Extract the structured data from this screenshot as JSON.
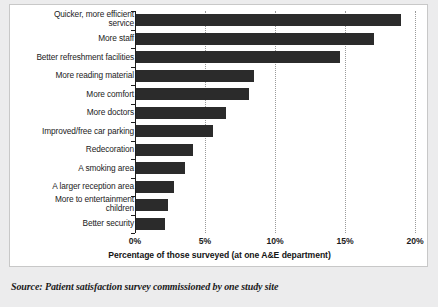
{
  "chart_data": {
    "type": "bar",
    "orientation": "horizontal",
    "title": "",
    "xlabel": "Percentage of those surveyed (at one A&E department)",
    "ylabel": "",
    "xlim": [
      0,
      20
    ],
    "xticks": [
      "0%",
      "5%",
      "10%",
      "15%",
      "20%"
    ],
    "xtick_values": [
      0,
      5,
      10,
      15,
      20
    ],
    "grid": "vertical-dotted",
    "legend": "none",
    "bar_color": "#2b2b2b",
    "categories": [
      "Quicker, more efficient service",
      "More staff",
      "Better refreshment facilities",
      "More reading material",
      "More comfort",
      "More doctors",
      "Improved/free car parking",
      "Redecoration",
      "A smoking area",
      "A larger reception area",
      "More to entertainment children",
      "Better security"
    ],
    "values": [
      18.9,
      17.0,
      14.6,
      8.4,
      8.1,
      6.4,
      5.5,
      4.1,
      3.5,
      2.7,
      2.3,
      2.1
    ]
  },
  "category_lines": [
    [
      "Quicker, more efficient",
      "service"
    ],
    [
      "More staff"
    ],
    [
      "Better refreshment facilities"
    ],
    [
      "More reading material"
    ],
    [
      "More comfort"
    ],
    [
      "More doctors"
    ],
    [
      "Improved/free car parking"
    ],
    [
      "Redecoration"
    ],
    [
      "A smoking area"
    ],
    [
      "A larger reception area"
    ],
    [
      "More to entertainment",
      "children"
    ],
    [
      "Better security"
    ]
  ],
  "caption": {
    "source": "Source: Patient satisfaction survey commissioned by one study site"
  }
}
